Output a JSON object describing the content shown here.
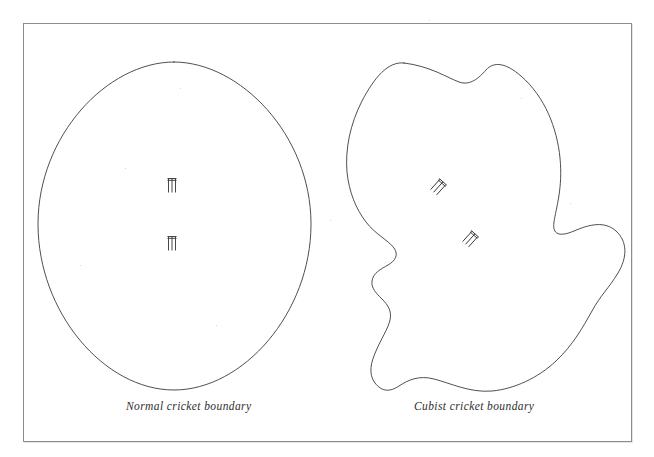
{
  "figure": {
    "frame": {
      "border_color": "#8d8d8d",
      "background": "#ffffff"
    },
    "panels": [
      {
        "id": "normal",
        "caption": "Normal cricket boundary",
        "shape_type": "oval",
        "wickets": 2
      },
      {
        "id": "cubist",
        "caption": "Cubist cricket boundary",
        "shape_type": "irregular-blob",
        "wickets": 2
      }
    ],
    "line_color": "#3b3b3b",
    "page_caption": ""
  },
  "icons": {
    "wicket": "cricket-stumps-icon"
  }
}
